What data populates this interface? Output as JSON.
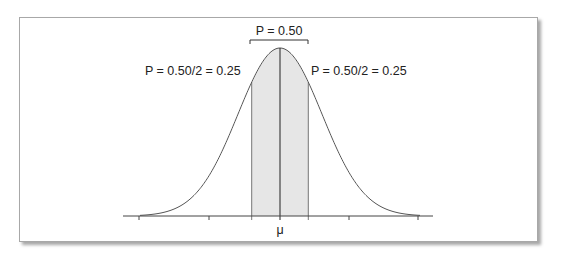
{
  "chart_data": {
    "type": "area",
    "title": "",
    "subtitle": "",
    "xlabel": "",
    "ylabel": "",
    "x_tick_labels": [
      "",
      "",
      "",
      "μ",
      "",
      "",
      ""
    ],
    "curve": "normal density",
    "shaded_region": {
      "from": "-0.674σ",
      "to": "+0.674σ",
      "probability": 0.5
    },
    "annotations": {
      "top": "P = 0.50",
      "left": "P = 0.50/2 = 0.25",
      "right": "P = 0.50/2 = 0.25"
    },
    "mean_label": "μ",
    "grid": false,
    "legend": null,
    "colors": {
      "curve": "#555555",
      "shade": "#e6e6e6",
      "axis": "#444444",
      "mean_line": "#222222"
    }
  }
}
